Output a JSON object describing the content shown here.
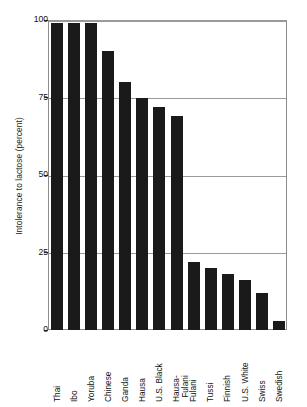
{
  "chart_data": {
    "type": "bar",
    "title": "",
    "subtitle": "",
    "xlabel": "",
    "ylabel": "Intolerance to lactose (percent)",
    "ylim": [
      0,
      100
    ],
    "yticks": [
      "0",
      "25",
      "50",
      "75",
      "100"
    ],
    "ytick_values": [
      0,
      25,
      50,
      75,
      100
    ],
    "grid": "horizontal",
    "legend": "none",
    "orientation": "vertical",
    "bar_color": "#1a1a1a",
    "categories": [
      "Thai",
      "Ibo",
      "Yoruba",
      "Chinese",
      "Ganda",
      "Hausa",
      "U.S. Black",
      "Hausa-Fulani",
      "Fulani",
      "Tussi",
      "Finnish",
      "U.S. White",
      "Swiss",
      "Swedish"
    ],
    "category_lines": [
      [
        "Thai"
      ],
      [
        "Ibo"
      ],
      [
        "Yoruba"
      ],
      [
        "Chinese"
      ],
      [
        "Ganda"
      ],
      [
        "Hausa"
      ],
      [
        "U.S. Black"
      ],
      [
        "Hausa-",
        "Fulani"
      ],
      [
        "Fulani"
      ],
      [
        "Tussi"
      ],
      [
        "Finnish"
      ],
      [
        "U.S. White"
      ],
      [
        "Swiss"
      ],
      [
        "Swedish"
      ]
    ],
    "values": [
      99,
      99,
      99,
      90,
      80,
      75,
      72,
      69,
      22,
      20,
      18,
      16,
      12,
      3
    ]
  }
}
